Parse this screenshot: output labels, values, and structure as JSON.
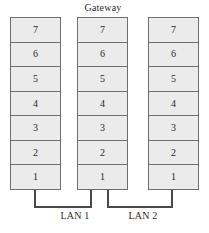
{
  "diagram": {
    "title": "Gateway",
    "layer_numbers": [
      "7",
      "6",
      "5",
      "4",
      "3",
      "2",
      "1"
    ],
    "stacks": [
      {
        "id": "left",
        "name": "protocol-stack-left",
        "layers": [
          "7",
          "6",
          "5",
          "4",
          "3",
          "2",
          "1"
        ]
      },
      {
        "id": "center",
        "name": "protocol-stack-gateway",
        "layers": [
          "7",
          "6",
          "5",
          "4",
          "3",
          "2",
          "1"
        ]
      },
      {
        "id": "right",
        "name": "protocol-stack-right",
        "layers": [
          "7",
          "6",
          "5",
          "4",
          "3",
          "2",
          "1"
        ]
      }
    ],
    "networks": [
      {
        "id": "lan1",
        "label": "LAN 1"
      },
      {
        "id": "lan2",
        "label": "LAN 2"
      }
    ],
    "colors": {
      "box_fill": "#ebebeb",
      "box_border": "#6e6e6e",
      "line": "#4a4a4a",
      "text": "#1f1f1f",
      "background": "#ffffff"
    }
  }
}
